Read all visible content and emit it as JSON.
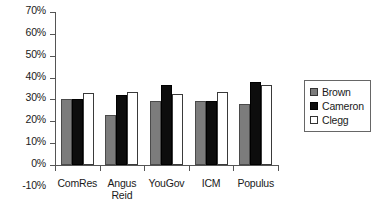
{
  "chart_data": {
    "type": "bar",
    "title": "",
    "subtitle": "",
    "xlabel": "",
    "ylabel": "",
    "categories": [
      "ComRes",
      "Angus\nReid",
      "YouGov",
      "ICM",
      "Populus"
    ],
    "series": [
      {
        "name": "Brown",
        "color": "#7c7c7c",
        "values": [
          30.0,
          23.0,
          29.5,
          29.5,
          28.0
        ]
      },
      {
        "name": "Cameron",
        "color": "#0d0d0d",
        "values": [
          30.0,
          32.0,
          36.5,
          29.5,
          38.0
        ]
      },
      {
        "name": "Clegg",
        "color": "#ffffff",
        "values": [
          33.0,
          33.5,
          32.5,
          33.5,
          36.5
        ]
      }
    ],
    "ylim": [
      -10,
      70
    ],
    "ytick_step": 10,
    "ytick_labels": [
      "70%",
      "60%",
      "50%",
      "40%",
      "30%",
      "20%",
      "10%",
      "0%",
      "-10%"
    ],
    "ytick_values": [
      70,
      60,
      50,
      40,
      30,
      20,
      10,
      0,
      -10
    ],
    "grid": false,
    "legend_position": "right",
    "legend_entries": [
      "Brown",
      "Cameron",
      "Clegg"
    ]
  },
  "legend": {
    "items": [
      {
        "label": "Brown"
      },
      {
        "label": "Cameron"
      },
      {
        "label": "Clegg"
      }
    ]
  }
}
